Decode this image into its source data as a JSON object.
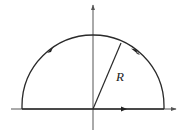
{
  "diagram": {
    "type": "semicircular contour in upper half-plane",
    "labels": {
      "radius": "R"
    },
    "colors": {
      "stroke": "#2a2a2a",
      "axis": "#555555",
      "background": "#ffffff"
    },
    "elements": [
      {
        "name": "x-axis",
        "direction": "rightward, arrowhead at right end"
      },
      {
        "name": "y-axis",
        "direction": "upward, arrowhead at top end"
      },
      {
        "name": "semicircle-arc",
        "orientation": "counter-clockwise"
      },
      {
        "name": "diameter-segment",
        "orientation": "left to right"
      },
      {
        "name": "radius-line",
        "label": "R"
      }
    ]
  }
}
